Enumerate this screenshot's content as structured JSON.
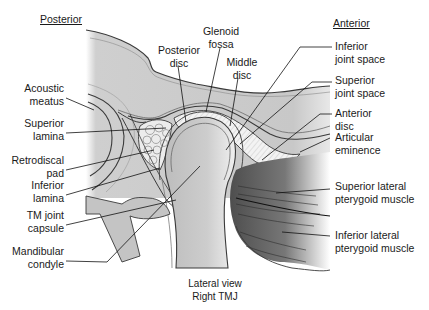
{
  "headings": {
    "posterior": "Posterior",
    "anterior": "Anterior"
  },
  "labels_left": [
    {
      "id": "acoustic-meatus",
      "line1": "Acoustic",
      "line2": "meatus"
    },
    {
      "id": "superior-lamina",
      "line1": "Superior",
      "line2": "lamina"
    },
    {
      "id": "retrodiscal-pad",
      "line1": "Retrodiscal",
      "line2": "pad"
    },
    {
      "id": "inferior-lamina",
      "line1": "Inferior",
      "line2": "lamina"
    },
    {
      "id": "tm-joint-capsule",
      "line1": "TM joint",
      "line2": "capsule"
    },
    {
      "id": "mandibular-condyle",
      "line1": "Mandibular",
      "line2": "condyle"
    }
  ],
  "labels_top": [
    {
      "id": "posterior-disc",
      "line1": "Posterior",
      "line2": "disc"
    },
    {
      "id": "glenoid-fossa",
      "line1": "Glenoid",
      "line2": "fossa"
    },
    {
      "id": "middle-disc",
      "line1": "Middle",
      "line2": "disc"
    }
  ],
  "labels_right": [
    {
      "id": "inferior-joint-space",
      "line1": "Inferior",
      "line2": "joint space"
    },
    {
      "id": "superior-joint-space",
      "line1": "Superior",
      "line2": "joint space"
    },
    {
      "id": "anterior-disc",
      "line1": "Anterior",
      "line2": "disc"
    },
    {
      "id": "articular-eminence",
      "line1": "Articular",
      "line2": "eminence"
    },
    {
      "id": "superior-lateral-pterygoid",
      "line1": "Superior lateral",
      "line2": "pterygoid muscle"
    },
    {
      "id": "inferior-lateral-pterygoid",
      "line1": "Inferior lateral",
      "line2": "pterygoid muscle"
    }
  ],
  "caption": {
    "line1": "Lateral view",
    "line2": "Right TMJ"
  },
  "colors": {
    "bone": "#cfcfcf",
    "bone_light": "#e6e6e6",
    "disc": "#f2f2f2",
    "muscle_dark": "#5a5a5a",
    "muscle_light": "#d8d8d8",
    "outline": "#3a3a3a",
    "leader": "#111111"
  }
}
